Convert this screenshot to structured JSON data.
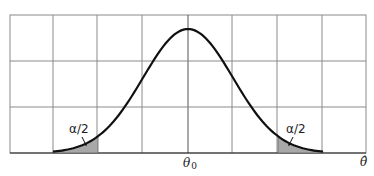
{
  "chart_data": {
    "type": "area",
    "title": "",
    "xlabel": "θ̂",
    "ylabel": "",
    "x_tick_labels": [
      {
        "position": 0,
        "label": "θ0"
      }
    ],
    "grid": true,
    "grid_columns": 8,
    "grid_rows": 3,
    "curve": {
      "type": "normal",
      "mean": 0,
      "sd": 1,
      "x_range": [
        -3,
        3
      ]
    },
    "shaded_regions": [
      {
        "side": "left",
        "x_from": -3,
        "x_to": -2,
        "label": "α/2"
      },
      {
        "side": "right",
        "x_from": 2,
        "x_to": 3,
        "label": "α/2"
      }
    ],
    "annotations": [
      "α/2",
      "α/2"
    ],
    "colors": {
      "curve": "#111111",
      "grid": "#8a8a8a",
      "shade": "#a8a8a8"
    }
  },
  "labels": {
    "center": "θ",
    "center_sub": "0",
    "axis": "θ̂",
    "left_tail": "α/2",
    "right_tail": "α/2"
  }
}
